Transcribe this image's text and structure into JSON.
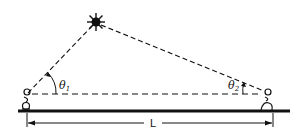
{
  "diagram": {
    "type": "triangulation",
    "labels": {
      "theta1": "θ",
      "theta1_sub": "1",
      "theta2": "θ",
      "theta2_sub": "2",
      "distance": "L"
    },
    "colors": {
      "ink": "#111111",
      "background": "#ffffff"
    }
  }
}
